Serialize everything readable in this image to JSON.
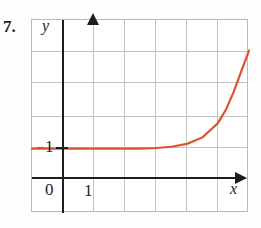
{
  "problem": {
    "number": "7."
  },
  "chart_data": {
    "type": "line",
    "title": "",
    "xlabel": "x",
    "ylabel": "y",
    "xlim": [
      -1,
      6
    ],
    "ylim": [
      -1,
      5
    ],
    "grid": true,
    "legend": false,
    "x_tick_labels": [
      "0",
      "1"
    ],
    "y_tick_labels": [
      "1"
    ],
    "origin_label": "0",
    "curve_color": "#e0512f",
    "axis_color": "#1d1d1d",
    "grid_color": "#c3c3c1",
    "series": [
      {
        "name": "f",
        "x": [
          -1.0,
          -0.5,
          0.0,
          0.5,
          1.0,
          1.5,
          2.0,
          2.5,
          3.0,
          3.5,
          4.0,
          4.5,
          5.0,
          5.25,
          5.5,
          5.75,
          6.0
        ],
        "y": [
          1.0,
          1.0,
          1.0,
          1.0,
          1.0,
          1.0,
          1.0,
          1.0,
          1.02,
          1.06,
          1.15,
          1.35,
          1.8,
          2.2,
          2.75,
          3.4,
          4.05
        ]
      }
    ]
  }
}
